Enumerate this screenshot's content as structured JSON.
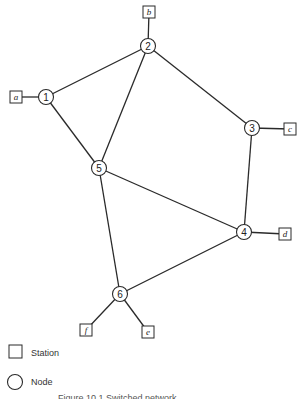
{
  "diagram": {
    "nodes": [
      {
        "id": "1",
        "label": "1",
        "x": 46,
        "y": 97
      },
      {
        "id": "2",
        "label": "2",
        "x": 148,
        "y": 46
      },
      {
        "id": "3",
        "label": "3",
        "x": 252,
        "y": 128
      },
      {
        "id": "4",
        "label": "4",
        "x": 244,
        "y": 232
      },
      {
        "id": "5",
        "label": "5",
        "x": 99,
        "y": 168
      },
      {
        "id": "6",
        "label": "6",
        "x": 120,
        "y": 294
      }
    ],
    "stations": [
      {
        "id": "a",
        "label": "a",
        "x": 16,
        "y": 97,
        "attached_to": "1"
      },
      {
        "id": "b",
        "label": "b",
        "x": 149,
        "y": 12,
        "attached_to": "2"
      },
      {
        "id": "c",
        "label": "c",
        "x": 290,
        "y": 129,
        "attached_to": "3"
      },
      {
        "id": "d",
        "label": "d",
        "x": 285,
        "y": 234,
        "attached_to": "4"
      },
      {
        "id": "f",
        "label": "f",
        "x": 86,
        "y": 330,
        "attached_to": "6"
      },
      {
        "id": "e",
        "label": "e",
        "x": 148,
        "y": 332,
        "attached_to": "6"
      }
    ],
    "links": [
      [
        "1",
        "2"
      ],
      [
        "1",
        "5"
      ],
      [
        "2",
        "5"
      ],
      [
        "2",
        "3"
      ],
      [
        "3",
        "4"
      ],
      [
        "5",
        "4"
      ],
      [
        "5",
        "6"
      ],
      [
        "6",
        "4"
      ]
    ]
  },
  "legend": {
    "station_label": "Station",
    "node_label": "Node"
  },
  "caption": {
    "text": "Figure 10.1 Switched network"
  }
}
